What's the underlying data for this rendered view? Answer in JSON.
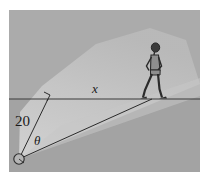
{
  "figure": {
    "panel": {
      "background_color": "#a9a9a9",
      "ground_color_above": "#aeaeae",
      "ground_color_below": "#a2a2a2",
      "x": 9,
      "y": 10,
      "width": 191,
      "height": 162
    },
    "outer_background_color": "#ffffff",
    "beam": {
      "name": "light-beam",
      "fill_color": "#c9c9c9",
      "fill_opacity": 0.75,
      "source_x": 19,
      "source_y": 159
    },
    "ground_line": {
      "name": "ground-line",
      "color": "#3a3a3a",
      "y": 99,
      "x_start": 9,
      "x_end": 200
    },
    "spotlight": {
      "name": "spotlight-source",
      "cx": 19,
      "cy": 159,
      "r": 5,
      "stroke_color": "#2b2b2b"
    },
    "person": {
      "name": "walking-person",
      "stroke_color": "#2b2b2b",
      "fill_color": "#8e8e8e",
      "ground_x": 152,
      "head_y": 45,
      "feet_y": 99
    },
    "segments": [
      {
        "name": "perpendicular-segment",
        "label": "20",
        "from_x": 19,
        "from_y": 159,
        "to_x": 48,
        "to_y": 99,
        "color": "#2b2b2b"
      },
      {
        "name": "hypotenuse-segment",
        "label": "",
        "from_x": 19,
        "from_y": 159,
        "to_x": 152,
        "to_y": 99,
        "color": "#2b2b2b"
      }
    ],
    "right_angle_marker": {
      "name": "right-angle-marker",
      "x": 48,
      "y": 99,
      "size": 6
    },
    "labels": {
      "distance": {
        "name": "label-distance-20",
        "text": "20",
        "x": 15,
        "y": 126
      },
      "horizontal": {
        "name": "label-horizontal-x",
        "text": "x",
        "x": 92,
        "y": 93
      },
      "angle": {
        "name": "label-angle-theta",
        "text": "θ",
        "x": 34,
        "y": 145
      }
    }
  }
}
